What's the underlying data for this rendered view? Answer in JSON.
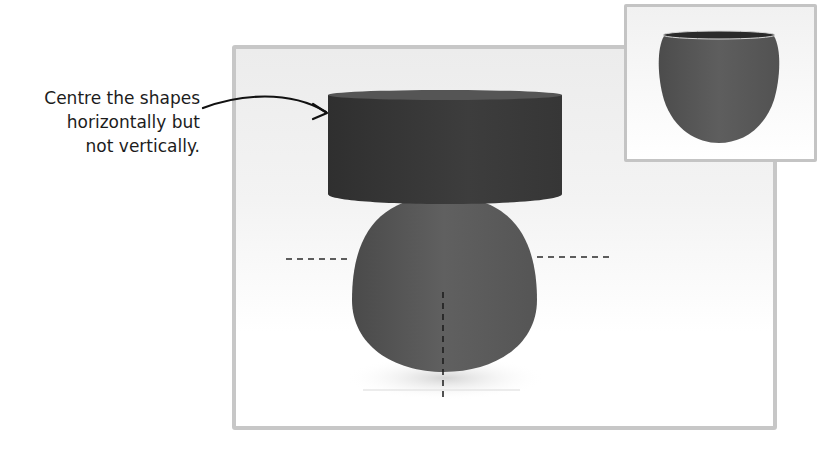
{
  "annotation": {
    "lines": [
      "Centre the shapes",
      "horizontally but",
      "not vertically."
    ]
  },
  "main_view": {
    "shapes": [
      "cylinder",
      "egg"
    ],
    "guides": [
      "horizontal-dashed-guide",
      "vertical-dashed-guide"
    ]
  },
  "inset_view": {
    "shape": "cup"
  },
  "colors": {
    "cylinder": "#3a3a3a",
    "egg": "#5a5a5a",
    "frame": "#c7c7c7",
    "text": "#1c1c1c"
  }
}
